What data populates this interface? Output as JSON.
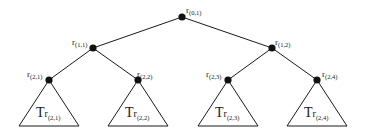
{
  "diagram": {
    "type": "binary-tree",
    "nodes": [
      {
        "id": "r01",
        "label": "r",
        "sub": "(0,1)",
        "x": 182,
        "y": 17
      },
      {
        "id": "r11",
        "label": "r",
        "sub": "(1,1)",
        "x": 93,
        "y": 48
      },
      {
        "id": "r12",
        "label": "r",
        "sub": "(1,2)",
        "x": 272,
        "y": 48
      },
      {
        "id": "r21",
        "label": "r",
        "sub": "(2,1)",
        "x": 49,
        "y": 80
      },
      {
        "id": "r22",
        "label": "r",
        "sub": "(2,2)",
        "x": 138,
        "y": 80
      },
      {
        "id": "r23",
        "label": "r",
        "sub": "(2,3)",
        "x": 228,
        "y": 80
      },
      {
        "id": "r24",
        "label": "r",
        "sub": "(2,4)",
        "x": 317,
        "y": 80
      }
    ],
    "edges": [
      [
        "r01",
        "r11"
      ],
      [
        "r01",
        "r12"
      ],
      [
        "r11",
        "r21"
      ],
      [
        "r11",
        "r22"
      ],
      [
        "r12",
        "r23"
      ],
      [
        "r12",
        "r24"
      ]
    ],
    "subtrees": [
      {
        "root": "r21",
        "label": "T",
        "sub_r": "r",
        "sub": "(2,1)"
      },
      {
        "root": "r22",
        "label": "T",
        "sub_r": "r",
        "sub": "(2,2)"
      },
      {
        "root": "r23",
        "label": "T",
        "sub_r": "r",
        "sub": "(2,3)"
      },
      {
        "root": "r24",
        "label": "T",
        "sub_r": "r",
        "sub": "(2,4)"
      }
    ]
  }
}
